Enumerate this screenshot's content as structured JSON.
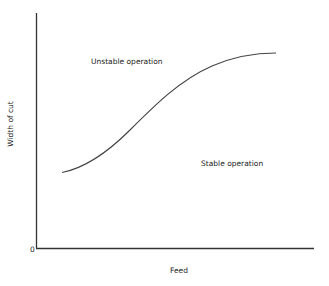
{
  "diagram": {
    "type": "stability-boundary",
    "x_axis": {
      "label": "Feed",
      "origin_label": "0"
    },
    "y_axis": {
      "label": "Width of cut"
    },
    "regions": {
      "upper": "Unstable operation",
      "lower": "Stable operation"
    },
    "curve": {
      "description": "S-shaped stability limit rising with feed, separating unstable (above) from stable (below) operation",
      "color": "#444444"
    },
    "colors": {
      "axis": "#333333",
      "curve": "#444444",
      "text": "#222222",
      "background": "#ffffff"
    }
  }
}
